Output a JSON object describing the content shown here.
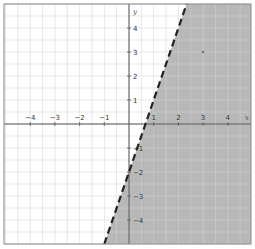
{
  "chart_data": {
    "type": "line",
    "title": "",
    "xlabel": "x",
    "ylabel": "y",
    "xlim": [
      -5,
      5
    ],
    "ylim": [
      -5,
      5
    ],
    "grid": true,
    "grid_step": 0.5,
    "x_tick_labels": [
      "-4",
      "-3",
      "-2",
      "-1",
      "1",
      "2",
      "3",
      "4"
    ],
    "x_tick_values": [
      -4,
      -3,
      -2,
      -1,
      1,
      2,
      3,
      4
    ],
    "y_tick_labels": [
      "4",
      "3",
      "2",
      "1",
      "-1",
      "-2",
      "-3",
      "-4"
    ],
    "y_tick_values": [
      4,
      3,
      2,
      1,
      -1,
      -2,
      -3,
      -4
    ],
    "series": [
      {
        "name": "boundary",
        "equation": "y = 3x - 2",
        "style": "dashed",
        "color": "#222222",
        "x": [
          -1,
          2.333
        ],
        "y": [
          -5,
          5
        ]
      }
    ],
    "shaded_region": {
      "inequality": "y < 3x - 2",
      "side": "below-right",
      "color": "#b8b8b8"
    },
    "test_point": {
      "x": 3,
      "y": 3
    }
  },
  "colors": {
    "background": "#ffffff",
    "grid": "#d4d4d4",
    "axis": "#555555",
    "frame": "#888888",
    "shade": "#b8b8b8",
    "line": "#222222"
  }
}
